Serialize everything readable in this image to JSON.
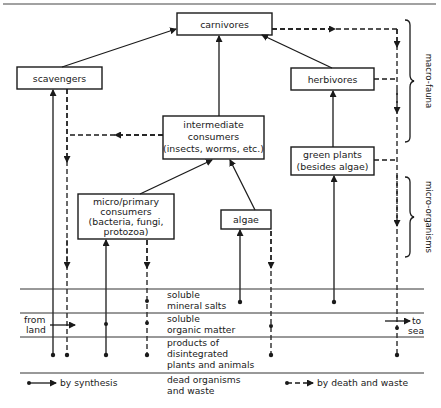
{
  "nodes": {
    "carnivores": "carnivores",
    "scavengers": "scavengers",
    "herbivores": "herbivores",
    "intermediate": [
      "intermediate",
      "consumers",
      "(insects, worms, etc.)"
    ],
    "green_plants": [
      "green plants",
      "(besides algae)"
    ],
    "micro_primary": [
      "micro/primary",
      "consumers",
      "(bacteria, fungi,",
      "protozoa)"
    ],
    "algae": "algae"
  },
  "side_labels": {
    "macro_fauna": "macro-fauna",
    "micro_organisms": "micro-organisms"
  },
  "layers": {
    "mineral_salts": [
      "soluble",
      "mineral salts"
    ],
    "organic_matter": [
      "soluble",
      "organic matter"
    ],
    "products": [
      "products of",
      "disintegrated",
      "plants and animals"
    ],
    "dead": [
      "dead organisms",
      "and waste"
    ]
  },
  "flows": {
    "from_land": [
      "from",
      "land"
    ],
    "to_sea": [
      "to",
      "sea"
    ]
  },
  "legend": {
    "synthesis": "by synthesis",
    "death_waste": "by death and waste"
  },
  "colors": {
    "ink": "#1a1a1a",
    "background": "#ffffff"
  }
}
